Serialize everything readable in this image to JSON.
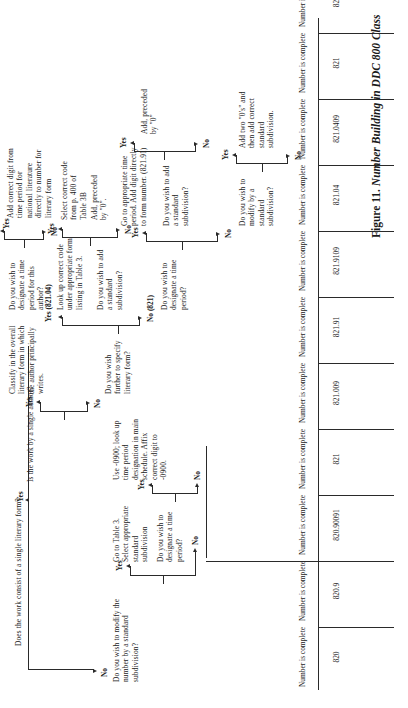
{
  "figure": {
    "caption_prefix": "Figure 11.",
    "caption_title": "Number Building in DDC 800 Class",
    "root_question": "Does the work consist of a single literary form?"
  },
  "branch_labels": {
    "yes": "Yes",
    "no": "No",
    "yes_821_04": "Yes (821.04)",
    "no_821": "No (821)"
  },
  "nodes": {
    "q_single_author": "Is the work by a single author?",
    "q_modify_std_sub": "Do you wish to modify the number by a standard subdivision?",
    "a_table3_select": "Go to Table 3. Select appropriate standard subdivision",
    "q_time_period_left": "Do you wish to designate a time period?",
    "a_use_0900": "Use -0900; look up time period designation in main schedule. Affix correct digit to -0900.",
    "q_specify_form": "Do you wish further to specify literary form?",
    "q_designate_time": "Do you wish to designate a time period?",
    "q_modify_std_sub2": "Do you wish to modify by a standard subdivision?",
    "a_add_two_zeros": "Add two \"0's\" and then add correct standard subdivision.",
    "a_goto_time_period": "Go to appropriate time period. Add digit directly to form number. (821.91)",
    "q_add_std_sub_mid": "Do you wish to add a standard subdivision?",
    "a_add_preceded_0": "Add, preceded by \"0\"",
    "a_lookup_code": "Look up correct code under appropriate form listing in Table 3.",
    "q_add_std_sub_right": "Do you wish to add a standard subdivision?",
    "a_select_code_38": "Select correct code from p. 400 of Table 3B",
    "a_add_preceded_0b": "Add, preceded by \"0\".",
    "a_classify_overall": "Classify in the overall literary form in which the author principally writes.",
    "q_time_period_author": "Do you wish to designate a time period for this author?",
    "a_add_correct_digit": "Add correct digit from time period for national literature directly to number for literary form"
  },
  "outcomes": [
    {
      "status": "Number is complete",
      "number": "820"
    },
    {
      "status": "Number is complete",
      "number": "820.9"
    },
    {
      "status": "Number is complete",
      "number": "820.90091"
    },
    {
      "status": "Number is complete",
      "number": "821"
    },
    {
      "status": "Number is complete",
      "number": "821.009"
    },
    {
      "status": "Number is complete",
      "number": "821.91"
    },
    {
      "status": "Number is complete",
      "number": "821.9109"
    },
    {
      "status": "Number is complete",
      "number": "821.04"
    },
    {
      "status": "Number is complete",
      "number": "821.0409"
    },
    {
      "status": "Number is complete",
      "number": "821"
    },
    {
      "status": "Number is complete",
      "number": "821.91"
    }
  ],
  "colors": {
    "ink": "#1a1a1a",
    "rule": "#2a2a2a",
    "paper": "#ffffff"
  }
}
